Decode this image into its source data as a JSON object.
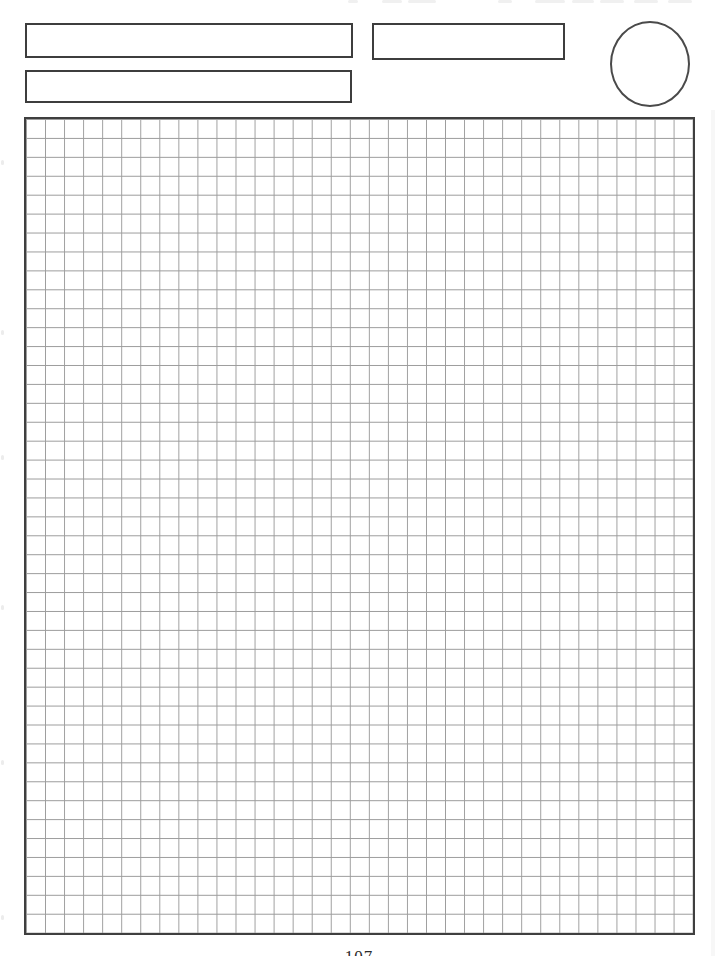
{
  "header": {
    "box_top": {
      "value": ""
    },
    "box_bottom": {
      "value": ""
    },
    "box_right": {
      "value": ""
    },
    "circle": {
      "value": ""
    }
  },
  "grid": {
    "columns": 35,
    "rows": 43,
    "line_color": "#9c9c9c",
    "border_color": "#3f3f3f",
    "background": "#ffffff"
  },
  "footer": {
    "page_number": "107"
  }
}
